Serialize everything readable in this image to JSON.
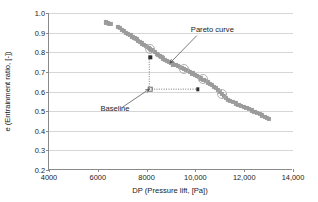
{
  "chart_data": {
    "type": "scatter",
    "title": "",
    "xlabel": "DP (Pressure lift, [Pa])",
    "ylabel": "e (Entrainment ratio, [-])",
    "xlim": [
      4000,
      14000
    ],
    "ylim": [
      0.2,
      1.0
    ],
    "grid": "horizontal",
    "legend": "none",
    "xticks": [
      {
        "value": 4000,
        "label": "4000"
      },
      {
        "value": 6000,
        "label": "6000"
      },
      {
        "value": 8000,
        "label": "8000"
      },
      {
        "value": 10000,
        "label": "10,000"
      },
      {
        "value": 12000,
        "label": "12,000"
      },
      {
        "value": 14000,
        "label": "14,000"
      }
    ],
    "yticks": [
      {
        "value": 1.0,
        "label": "1.0"
      },
      {
        "value": 0.9,
        "label": "0.9"
      },
      {
        "value": 0.8,
        "label": "0.8"
      },
      {
        "value": 0.7,
        "label": "0.7"
      },
      {
        "value": 0.6,
        "label": "0.6"
      },
      {
        "value": 0.5,
        "label": "0.5"
      },
      {
        "value": 0.4,
        "label": "0.4"
      },
      {
        "value": 0.3,
        "label": "0.3"
      },
      {
        "value": 0.2,
        "label": "0.2"
      }
    ],
    "series": [
      {
        "name": "Pareto front",
        "marker": "square",
        "color": "#9b9b9b",
        "points": [
          [
            6330,
            0.952
          ],
          [
            6390,
            0.95
          ],
          [
            6450,
            0.945
          ],
          [
            6530,
            0.944
          ],
          [
            6820,
            0.93
          ],
          [
            6900,
            0.923
          ],
          [
            7000,
            0.915
          ],
          [
            7080,
            0.908
          ],
          [
            7160,
            0.9
          ],
          [
            7250,
            0.893
          ],
          [
            7340,
            0.887
          ],
          [
            7420,
            0.88
          ],
          [
            7500,
            0.872
          ],
          [
            7580,
            0.866
          ],
          [
            7660,
            0.858
          ],
          [
            7740,
            0.851
          ],
          [
            7820,
            0.845
          ],
          [
            7900,
            0.838
          ],
          [
            7960,
            0.833
          ],
          [
            8020,
            0.828
          ],
          [
            8080,
            0.822
          ],
          [
            8140,
            0.818
          ],
          [
            8200,
            0.812
          ],
          [
            8270,
            0.806
          ],
          [
            8340,
            0.8
          ],
          [
            8410,
            0.793
          ],
          [
            8470,
            0.787
          ],
          [
            8540,
            0.781
          ],
          [
            8610,
            0.775
          ],
          [
            8680,
            0.769
          ],
          [
            8760,
            0.762
          ],
          [
            8840,
            0.756
          ],
          [
            8920,
            0.75
          ],
          [
            9000,
            0.744
          ],
          [
            9090,
            0.738
          ],
          [
            9180,
            0.734
          ],
          [
            9270,
            0.73
          ],
          [
            9360,
            0.726
          ],
          [
            9450,
            0.721
          ],
          [
            9540,
            0.716
          ],
          [
            9620,
            0.71
          ],
          [
            9700,
            0.704
          ],
          [
            9790,
            0.698
          ],
          [
            9880,
            0.692
          ],
          [
            9970,
            0.686
          ],
          [
            10060,
            0.68
          ],
          [
            10150,
            0.673
          ],
          [
            10240,
            0.667
          ],
          [
            10330,
            0.66
          ],
          [
            10420,
            0.653
          ],
          [
            10510,
            0.646
          ],
          [
            10600,
            0.639
          ],
          [
            10680,
            0.632
          ],
          [
            10760,
            0.625
          ],
          [
            10840,
            0.617
          ],
          [
            10920,
            0.608
          ],
          [
            11000,
            0.598
          ],
          [
            11080,
            0.588
          ],
          [
            11160,
            0.577
          ],
          [
            11240,
            0.566
          ],
          [
            11330,
            0.557
          ],
          [
            11430,
            0.551
          ],
          [
            11540,
            0.545
          ],
          [
            11650,
            0.539
          ],
          [
            11760,
            0.533
          ],
          [
            11870,
            0.528
          ],
          [
            11980,
            0.522
          ],
          [
            12090,
            0.516
          ],
          [
            12200,
            0.51
          ],
          [
            12310,
            0.504
          ],
          [
            12420,
            0.498
          ],
          [
            12530,
            0.492
          ],
          [
            12640,
            0.485
          ],
          [
            12740,
            0.478
          ],
          [
            12840,
            0.471
          ],
          [
            12940,
            0.464
          ],
          [
            13000,
            0.46
          ]
        ]
      }
    ],
    "highlight_rings": [
      [
        8150,
        0.818
      ],
      [
        9540,
        0.716
      ],
      [
        10300,
        0.663
      ],
      [
        11080,
        0.588
      ]
    ],
    "annotations": [
      {
        "name": "pareto-curve",
        "text": "Pareto curve",
        "label_x": 10100,
        "label_y": 0.885,
        "arrow_to_x": 9000,
        "arrow_to_y": 0.745
      },
      {
        "name": "baseline",
        "text": "Baseline",
        "label_x": 7050,
        "label_y": 0.52,
        "arrow_to_x": 8150,
        "arrow_to_y": 0.612
      }
    ],
    "baseline_point": {
      "x": 8150,
      "y": 0.612,
      "marker": "open-square"
    },
    "improvement_arrows": [
      {
        "name": "entrainment-gain-arrow",
        "from_x": 8150,
        "from_y": 0.612,
        "to_x": 8150,
        "to_y": 0.775,
        "style": "dotted",
        "head": "filled-square"
      },
      {
        "name": "pressure-lift-gain-arrow",
        "from_x": 8150,
        "from_y": 0.612,
        "to_x": 10100,
        "to_y": 0.612,
        "style": "dotted",
        "head": "filled-square"
      }
    ]
  }
}
